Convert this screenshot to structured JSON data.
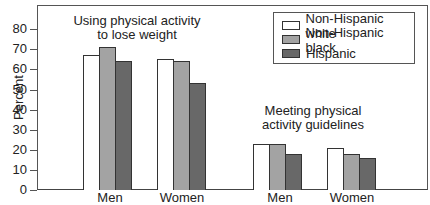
{
  "chart_data": {
    "type": "bar",
    "title": "",
    "xlabel": "",
    "ylabel": "Percent",
    "ylim": [
      0,
      90
    ],
    "yticks": [
      0,
      10,
      20,
      30,
      40,
      50,
      60,
      70,
      80
    ],
    "groups": [
      {
        "annotation": [
          "Using physical activity",
          "to lose weight"
        ],
        "categories": [
          "Men",
          "Women"
        ]
      },
      {
        "annotation": [
          "Meeting physical",
          "activity guidelines"
        ],
        "categories": [
          "Men",
          "Women"
        ]
      }
    ],
    "categories": [
      "Men (lose weight)",
      "Women (lose weight)",
      "Men (guidelines)",
      "Women (guidelines)"
    ],
    "series": [
      {
        "name": "Non-Hispanic white",
        "color": "#ffffff",
        "values": [
          67,
          65,
          23,
          21
        ]
      },
      {
        "name": "Non-Hispanic black",
        "color": "#a3a3a3",
        "values": [
          71,
          64,
          23,
          18
        ]
      },
      {
        "name": "Hispanic",
        "color": "#686868",
        "values": [
          64,
          53,
          18,
          16
        ]
      }
    ],
    "legend_position": "upper right",
    "grid": false
  },
  "axis": {
    "ylabel": "Percent",
    "ticks": [
      "0",
      "10",
      "20",
      "30",
      "40",
      "50",
      "60",
      "70",
      "80"
    ]
  },
  "annotations": {
    "group1_line1": "Using physical activity",
    "group1_line2": "to lose weight",
    "group2_line1": "Meeting physical",
    "group2_line2": "activity guidelines"
  },
  "xlabels": [
    "Men",
    "Women",
    "Men",
    "Women"
  ],
  "legend": [
    "Non-Hispanic white",
    "Non-Hispanic black",
    "Hispanic"
  ]
}
